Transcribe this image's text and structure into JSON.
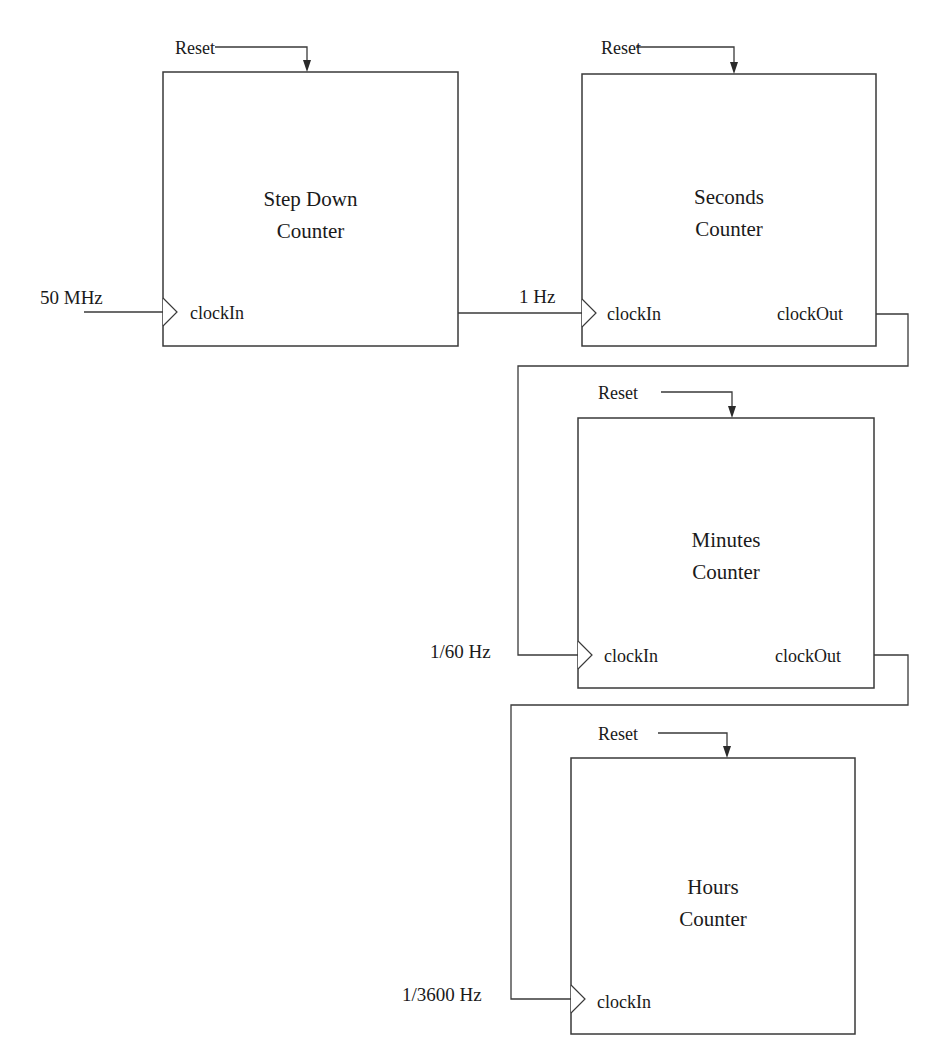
{
  "diagram": {
    "type": "block-diagram",
    "blocks": [
      {
        "id": "step-down",
        "title_line1": "Step Down",
        "title_line2": "Counter",
        "reset_label": "Reset",
        "input_port": "clockIn",
        "output_port": null
      },
      {
        "id": "seconds",
        "title_line1": "Seconds",
        "title_line2": "Counter",
        "reset_label": "Reset",
        "input_port": "clockIn",
        "output_port": "clockOut"
      },
      {
        "id": "minutes",
        "title_line1": "Minutes",
        "title_line2": "Counter",
        "reset_label": "Reset",
        "input_port": "clockIn",
        "output_port": "clockOut"
      },
      {
        "id": "hours",
        "title_line1": "Hours",
        "title_line2": "Counter",
        "reset_label": "Reset",
        "input_port": "clockIn",
        "output_port": null
      }
    ],
    "signals": [
      {
        "label": "50 MHz",
        "to": "step-down.clockIn"
      },
      {
        "label": "1 Hz",
        "from": "step-down",
        "to": "seconds.clockIn"
      },
      {
        "label": "1/60 Hz",
        "from": "seconds.clockOut",
        "to": "minutes.clockIn"
      },
      {
        "label": "1/3600 Hz",
        "from": "minutes.clockOut",
        "to": "hours.clockIn"
      }
    ],
    "colors": {
      "line": "#3a3a3a",
      "text": "#1a1a1a",
      "background": "#ffffff"
    }
  }
}
